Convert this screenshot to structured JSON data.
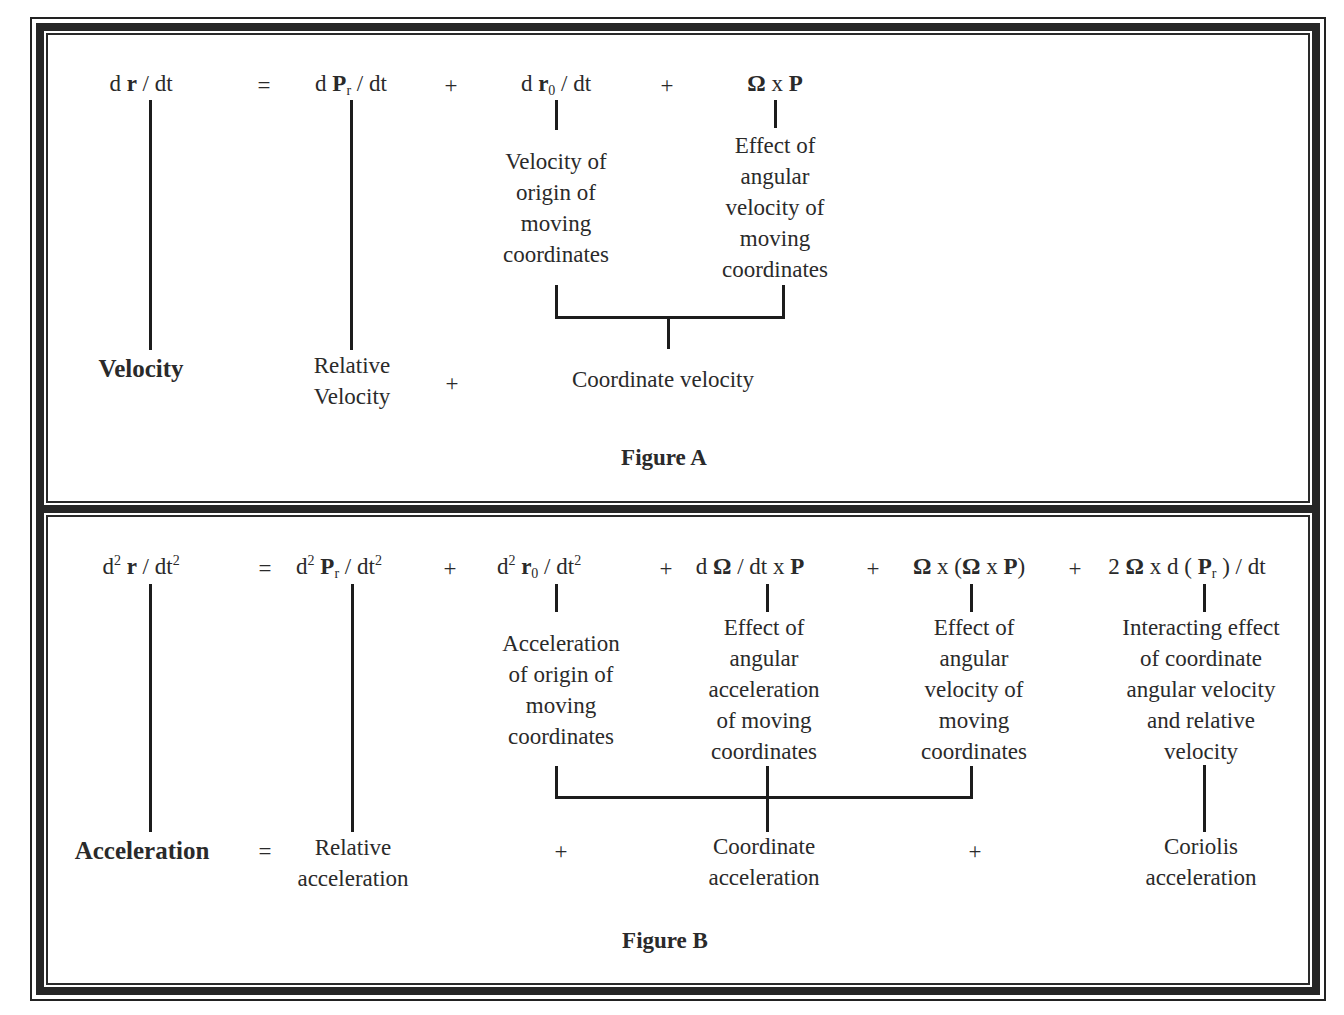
{
  "figure_a": {
    "caption": "Figure A",
    "equation": {
      "lhs": {
        "d": "d ",
        "var": "r",
        "rest": " / dt"
      },
      "equals": "=",
      "term1": {
        "d": "d ",
        "var": "P",
        "sub": "r",
        "rest": " / dt"
      },
      "plus1": "+",
      "term2": {
        "d": "d ",
        "var": "r",
        "sub": "0",
        "rest": " / dt"
      },
      "plus2": "+",
      "term3": {
        "omega": "Ω",
        "x": " x ",
        "var": "P"
      }
    },
    "descriptions": {
      "term2": [
        "Velocity of",
        "origin of",
        "moving",
        "coordinates"
      ],
      "term3": [
        "Effect of",
        "angular",
        "velocity of",
        "moving",
        "coordinates"
      ]
    },
    "summary": {
      "lhs_label": "Velocity",
      "term1_label": [
        "Relative",
        "Velocity"
      ],
      "plus": "+",
      "coordinate_label": "Coordinate velocity"
    }
  },
  "figure_b": {
    "caption": "Figure B",
    "equation": {
      "lhs": {
        "d": "d",
        "sup": "2",
        "var": "r",
        "rest": " / dt",
        "rest_sup": "2"
      },
      "equals": "=",
      "term1": {
        "d": "d",
        "sup": "2",
        "var": "P",
        "sub": "r",
        "rest": " / dt",
        "rest_sup": "2"
      },
      "plus1": "+",
      "term2": {
        "d": "d",
        "sup": "2",
        "var": "r",
        "sub": "0",
        "rest": " / dt",
        "rest_sup": "2"
      },
      "plus2": "+",
      "term3": {
        "d": "d ",
        "omega": "Ω",
        "rest": " / dt x ",
        "var": "P"
      },
      "plus3": "+",
      "term4": {
        "omega": "Ω",
        "x": " x (",
        "omega2": "Ω",
        "x2": " x ",
        "var": "P",
        "close": ")"
      },
      "plus4": "+",
      "term5": {
        "two": "2 ",
        "omega": "Ω",
        "x": " x d ( ",
        "var": "P",
        "sub": "r",
        "rest": " ) / dt"
      }
    },
    "descriptions": {
      "term2": [
        "Acceleration",
        "of origin of",
        "moving",
        "coordinates"
      ],
      "term3": [
        "Effect of",
        "angular",
        "acceleration",
        "of moving",
        "coordinates"
      ],
      "term4": [
        "Effect of",
        "angular",
        "velocity of",
        "moving",
        "coordinates"
      ],
      "term5": [
        "Interacting effect",
        "of coordinate",
        "angular velocity",
        "and relative",
        "velocity"
      ]
    },
    "summary": {
      "lhs_label": "Acceleration",
      "equals": "=",
      "term1_label": [
        "Relative",
        "acceleration"
      ],
      "plus1": "+",
      "coordinate_label": [
        "Coordinate",
        "acceleration"
      ],
      "plus2": "+",
      "coriolis_label": [
        "Coriolis",
        "acceleration"
      ]
    }
  }
}
